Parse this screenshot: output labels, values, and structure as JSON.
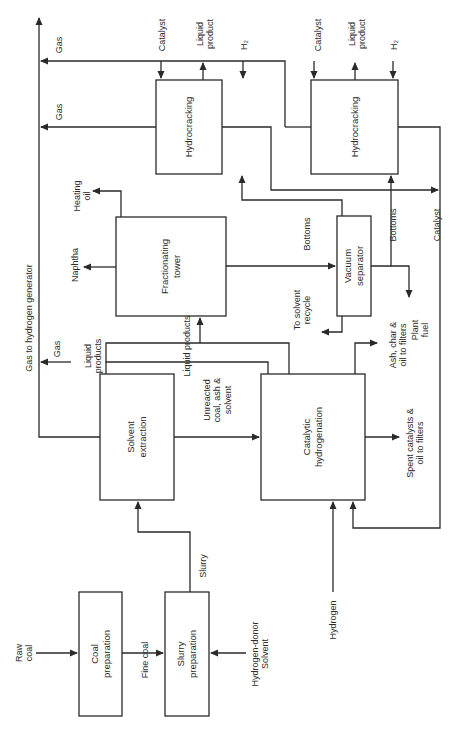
{
  "diagram": {
    "orientation": "rotated 90 degrees counter-clockwise",
    "nodes": [
      {
        "id": "coal-preparation",
        "lines": [
          "Coal",
          "preparation"
        ],
        "x": 79,
        "y": 592,
        "w": 43,
        "h": 124
      },
      {
        "id": "slurry-preparation",
        "lines": [
          "Slurry",
          "preparation"
        ],
        "x": 165,
        "y": 592,
        "w": 44,
        "h": 124
      },
      {
        "id": "solvent-extraction",
        "lines": [
          "Solvent",
          "extraction"
        ],
        "x": 100,
        "y": 374,
        "w": 74,
        "h": 126
      },
      {
        "id": "catalytic-hydrogenation",
        "lines": [
          "Catalytic",
          "hydrogenation"
        ],
        "x": 261,
        "y": 374,
        "w": 104,
        "h": 126
      },
      {
        "id": "fractionating-tower",
        "lines": [
          "Fractionating",
          "tower"
        ],
        "x": 116,
        "y": 217,
        "w": 110,
        "h": 99
      },
      {
        "id": "vacuum-separator",
        "lines": [
          "Vacuum",
          "separator"
        ],
        "x": 337,
        "y": 216,
        "w": 34,
        "h": 100
      },
      {
        "id": "hydrocracking-1",
        "lines": [
          "Hydrocracking"
        ],
        "x": 156,
        "y": 80,
        "w": 66,
        "h": 94
      },
      {
        "id": "hydrocracking-2",
        "lines": [
          "Hydrocracking"
        ],
        "x": 311,
        "y": 80,
        "w": 87,
        "h": 94
      }
    ],
    "labels": [
      {
        "id": "raw-coal",
        "lines": [
          "Raw",
          "coal"
        ],
        "x": 24,
        "y": 653
      },
      {
        "id": "fine-coal",
        "lines": [
          "Fine coal"
        ],
        "x": 145,
        "y": 660
      },
      {
        "id": "hydrogen-donor-solvent",
        "lines": [
          "Hydrogen-donor",
          "Solvent"
        ],
        "x": 260,
        "y": 654
      },
      {
        "id": "slurry",
        "lines": [
          "Slurry"
        ],
        "x": 203,
        "y": 566
      },
      {
        "id": "hydrogen",
        "lines": [
          "Hydrogen"
        ],
        "x": 333,
        "y": 620
      },
      {
        "id": "unreacted-coal",
        "lines": [
          "Unreacted",
          "coal, ash &",
          "solvent"
        ],
        "x": 217,
        "y": 400
      },
      {
        "id": "spent-catalysts",
        "lines": [
          "Spent catalysts &",
          "oil to filters"
        ],
        "x": 415,
        "y": 443
      },
      {
        "id": "ash-char",
        "lines": [
          "Ash, char &",
          "oil to filters"
        ],
        "x": 398,
        "y": 345
      },
      {
        "id": "plant-fuel",
        "lines": [
          "Plant",
          "fuel"
        ],
        "x": 420,
        "y": 330
      },
      {
        "id": "liquid-products-side",
        "lines": [
          "Liquid",
          "products"
        ],
        "x": 93,
        "y": 356
      },
      {
        "id": "liquid-products-bar",
        "lines": [
          "Liquid products"
        ],
        "x": 187,
        "y": 346
      },
      {
        "id": "gas-lower",
        "lines": [
          "Gas"
        ],
        "x": 57,
        "y": 349
      },
      {
        "id": "gas-to-hydrogen-generator",
        "lines": [
          "Gas to hydrogen generator"
        ],
        "x": 29,
        "y": 318
      },
      {
        "id": "naphtha",
        "lines": [
          "Naphtha"
        ],
        "x": 75,
        "y": 265
      },
      {
        "id": "heating-oil",
        "lines": [
          "Heating",
          "oil"
        ],
        "x": 82,
        "y": 196
      },
      {
        "id": "bottoms-1",
        "lines": [
          "Bottoms"
        ],
        "x": 307,
        "y": 234
      },
      {
        "id": "to-solvent-recycle",
        "lines": [
          "To solvent",
          "recycle"
        ],
        "x": 302,
        "y": 310
      },
      {
        "id": "bottoms-2",
        "lines": [
          "Bottoms"
        ],
        "x": 393,
        "y": 225
      },
      {
        "id": "catalyst-right",
        "lines": [
          "Catalyst"
        ],
        "x": 437,
        "y": 225
      },
      {
        "id": "gas-top",
        "lines": [
          "Gas"
        ],
        "x": 59,
        "y": 45
      },
      {
        "id": "gas-mid",
        "lines": [
          "Gas"
        ],
        "x": 59,
        "y": 112
      },
      {
        "id": "catalyst-1",
        "lines": [
          "Catalyst"
        ],
        "x": 162,
        "y": 35
      },
      {
        "id": "liquid-product-1",
        "lines": [
          "Liquid",
          "product"
        ],
        "x": 205,
        "y": 34
      },
      {
        "id": "h2-1",
        "lines": [
          "H₂"
        ],
        "x": 244,
        "y": 45
      },
      {
        "id": "catalyst-2",
        "lines": [
          "Catalyst"
        ],
        "x": 318,
        "y": 35
      },
      {
        "id": "liquid-product-2",
        "lines": [
          "Liquid",
          "product"
        ],
        "x": 357,
        "y": 34
      },
      {
        "id": "h2-2",
        "lines": [
          "H₂"
        ],
        "x": 394,
        "y": 45
      }
    ]
  }
}
